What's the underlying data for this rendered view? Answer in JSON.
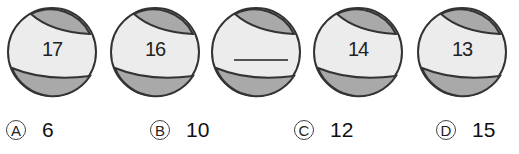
{
  "balls": [
    {
      "label": "17"
    },
    {
      "label": "16"
    },
    {
      "label": ""
    },
    {
      "label": "14"
    },
    {
      "label": "13"
    }
  ],
  "options": [
    {
      "letter": "A",
      "value": "6"
    },
    {
      "letter": "B",
      "value": "10"
    },
    {
      "letter": "C",
      "value": "12"
    },
    {
      "letter": "D",
      "value": "15"
    }
  ],
  "colors": {
    "ball_fill": "#ececec",
    "ball_band": "#a9a9a9",
    "outline": "#333333"
  }
}
